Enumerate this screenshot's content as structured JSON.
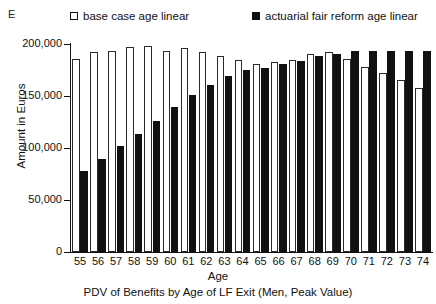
{
  "panel_label": "E",
  "legend": {
    "position": "top",
    "items": [
      {
        "label": "base case age linear",
        "marker": "open-square",
        "color": "#ffffff"
      },
      {
        "label": "actuarial fair reform age linear",
        "marker": "filled-square",
        "color": "#111111"
      }
    ]
  },
  "axes": {
    "y_title": "Amount in Euros",
    "x_title": "Age",
    "y_ticks": [
      "0",
      "50,000",
      "100,000",
      "150,000",
      "200,000"
    ]
  },
  "caption": "PDV of Benefits by Age of LF Exit (Men, Peak Value)",
  "chart_data": {
    "type": "bar",
    "title": "PDV of Benefits by Age of LF Exit (Men, Peak Value)",
    "xlabel": "Age",
    "ylabel": "Amount in Euros",
    "ylim": [
      0,
      200000
    ],
    "ytick_values": [
      0,
      50000,
      100000,
      150000,
      200000
    ],
    "grid": false,
    "legend_position": "top",
    "categories": [
      "55",
      "56",
      "57",
      "58",
      "59",
      "60",
      "61",
      "62",
      "63",
      "64",
      "65",
      "66",
      "67",
      "68",
      "69",
      "70",
      "71",
      "72",
      "73",
      "74"
    ],
    "series": [
      {
        "name": "base case age linear",
        "color": "#ffffff",
        "values": [
          186000,
          192000,
          193000,
          197000,
          198000,
          193000,
          196000,
          192000,
          188000,
          185000,
          181000,
          183000,
          185000,
          190000,
          192000,
          186000,
          178000,
          172000,
          165000,
          158000
        ]
      },
      {
        "name": "actuarial fair reform age linear",
        "color": "#111111",
        "values": [
          78000,
          89000,
          102000,
          113000,
          126000,
          139000,
          151000,
          161000,
          169000,
          175000,
          177000,
          181000,
          184000,
          188000,
          190000,
          193000,
          193000,
          193000,
          193000,
          193000
        ]
      }
    ]
  }
}
